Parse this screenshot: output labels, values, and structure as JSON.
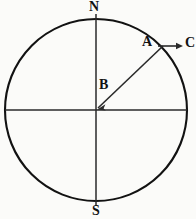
{
  "figure": {
    "type": "geometry-diagram",
    "background_color": "#fbfbf9",
    "stroke_color": "#121212"
  },
  "labels": {
    "north": "N",
    "south": "S",
    "point_a": "A",
    "point_b": "B",
    "point_c": "C"
  },
  "geometry": {
    "circle": {
      "cx": 96,
      "cy": 110,
      "r": 91
    },
    "vertical_diameter": {
      "x": 96,
      "y1": 16,
      "y2": 206
    },
    "horizontal_diameter": {
      "y": 110,
      "x1": 5,
      "x2": 187
    },
    "radius_line": {
      "x1": 96,
      "y1": 110,
      "x2": 162,
      "y2": 47
    },
    "radius_arrowhead_at": {
      "x": 101,
      "y": 105
    },
    "tangent_arrow": {
      "x1": 158,
      "y1": 46,
      "x2": 182,
      "y2": 46
    }
  }
}
